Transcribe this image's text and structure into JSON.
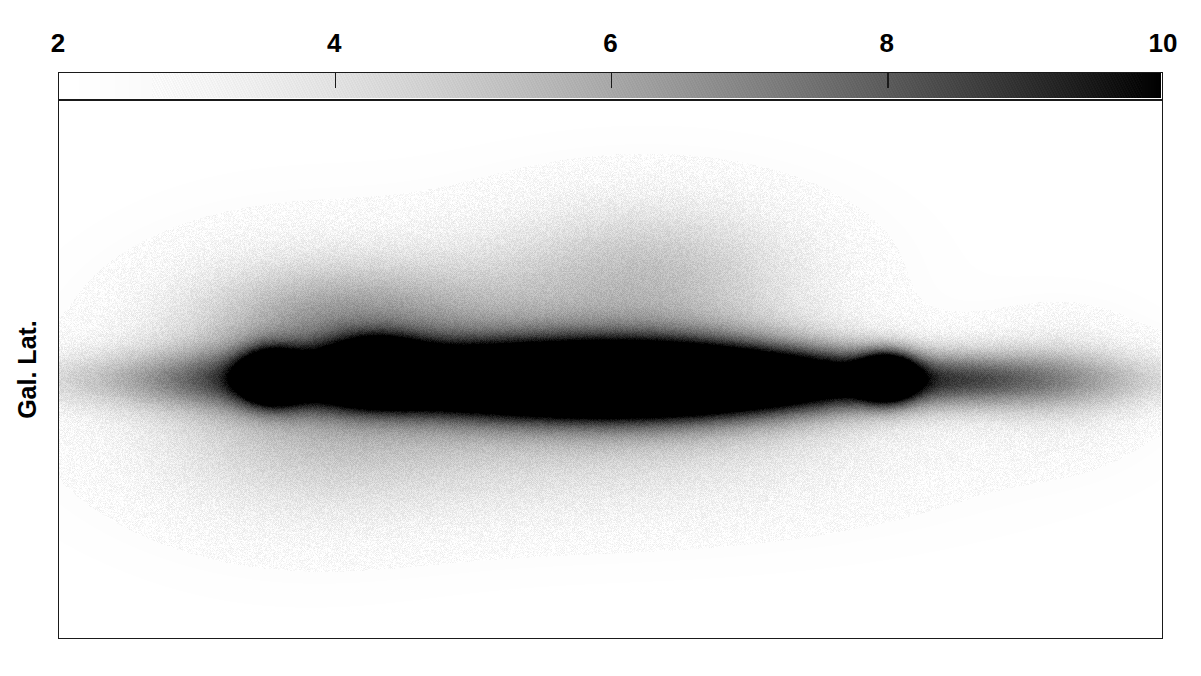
{
  "figure": {
    "width": 1201,
    "height": 676,
    "background": "#ffffff",
    "ink_color": "#1a1a1a"
  },
  "axes": {
    "y_title": "Gal. Lat.",
    "plot_box": {
      "left": 58,
      "top": 100,
      "right": 1163,
      "bottom": 639
    }
  },
  "colorbar": {
    "box": {
      "left": 58,
      "top": 72,
      "right": 1163,
      "bottom": 100
    },
    "orientation": "horizontal",
    "label_position": "top",
    "min": 2,
    "max": 10,
    "tick_values": [
      2,
      4,
      6,
      8,
      10
    ],
    "tick_labels": [
      "2",
      "4",
      "6",
      "8",
      "10"
    ],
    "start_color": "#ffffff",
    "end_color": "#000000",
    "colormap": "grayscale-inverted"
  },
  "chart_data": {
    "type": "heatmap",
    "title": "",
    "subtitle": "",
    "xlabel": "",
    "ylabel": "Gal. Lat.",
    "grid": false,
    "legend_position": "top",
    "colorbar_label": "",
    "colorbar_range": [
      2,
      10
    ],
    "colorbar_ticks": [
      2,
      4,
      6,
      8,
      10
    ],
    "xlim": [
      0,
      1
    ],
    "ylim": [
      0,
      1
    ],
    "xticklabels": [],
    "yticklabels": [],
    "value_min": 2,
    "value_max": 10,
    "features": [
      {
        "name": "galactic-plane-ridge",
        "cx": 0.5,
        "cy": 0.52,
        "rx": 0.4,
        "ry": 0.055,
        "peak": 10.0
      },
      {
        "name": "central-saturated-core",
        "cx": 0.51,
        "cy": 0.52,
        "rx": 0.18,
        "ry": 0.085,
        "peak": 10.0
      },
      {
        "name": "compact-source-left",
        "cx": 0.193,
        "cy": 0.515,
        "rx": 0.026,
        "ry": 0.045,
        "peak": 10.0
      },
      {
        "name": "ridge-bump-left",
        "cx": 0.288,
        "cy": 0.5,
        "rx": 0.04,
        "ry": 0.05,
        "peak": 10.0
      },
      {
        "name": "compact-source-right",
        "cx": 0.752,
        "cy": 0.515,
        "rx": 0.024,
        "ry": 0.042,
        "peak": 10.0
      },
      {
        "name": "upper-diffuse-bubble",
        "cx": 0.535,
        "cy": 0.33,
        "rx": 0.155,
        "ry": 0.155,
        "peak": 5.2
      },
      {
        "name": "upper-left-lobe",
        "cx": 0.275,
        "cy": 0.4,
        "rx": 0.14,
        "ry": 0.11,
        "peak": 4.6
      },
      {
        "name": "left-halo",
        "cx": 0.215,
        "cy": 0.53,
        "rx": 0.15,
        "ry": 0.23,
        "peak": 4.4
      },
      {
        "name": "lower-diffuse-envelope",
        "cx": 0.47,
        "cy": 0.64,
        "rx": 0.3,
        "ry": 0.15,
        "peak": 4.2
      },
      {
        "name": "right-faint-blob",
        "cx": 0.912,
        "cy": 0.52,
        "rx": 0.075,
        "ry": 0.115,
        "peak": 3.6
      },
      {
        "name": "right-bridge",
        "cx": 0.83,
        "cy": 0.52,
        "rx": 0.06,
        "ry": 0.05,
        "peak": 3.0
      }
    ]
  }
}
